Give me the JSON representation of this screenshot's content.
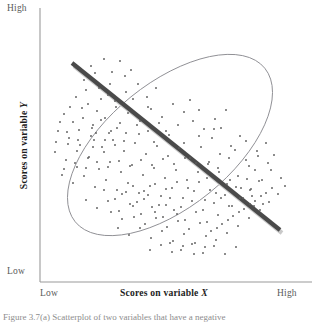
{
  "figure": {
    "caption": "Figure 3.7(a)  Scatterplot of two variables that have a negative",
    "y_axis": {
      "title_prefix": "Scores on variable ",
      "title_var": "Y",
      "high_label": "High",
      "low_label": "Low"
    },
    "x_axis": {
      "title_prefix": "Scores on variable ",
      "title_var": "X",
      "low_label": "Low",
      "high_label": "High"
    }
  },
  "colors": {
    "axis": "#9a9a9a",
    "ellipse": "#8e8e93",
    "regression_line": "#4a4a4a",
    "regression_shadow": "#c9c9c9",
    "dot": "#5c5c5c",
    "label_text": "#5a5a5a",
    "title_text": "#1d1d1d",
    "background": "#ffffff"
  },
  "chart_data": {
    "type": "scatter",
    "title": "",
    "subtitle": "",
    "xlabel": "Scores on variable X",
    "ylabel": "Scores on variable Y",
    "xlim": [
      0,
      100
    ],
    "ylim": [
      0,
      100
    ],
    "xtick_labels": [
      "Low",
      "High"
    ],
    "ytick_labels": [
      "Low",
      "High"
    ],
    "grid": false,
    "legend": null,
    "correlation": "negative",
    "annotations": [
      {
        "kind": "ellipse",
        "center": [
          170,
          145
        ],
        "rx": 122,
        "ry": 62,
        "rotation_deg": -39
      },
      {
        "kind": "regression-line",
        "x1": 72,
        "y1": 63,
        "x2": 280,
        "y2": 230
      }
    ],
    "points": [
      [
        91,
        66
      ],
      [
        104,
        59
      ],
      [
        112,
        72
      ],
      [
        84,
        80
      ],
      [
        99,
        88
      ],
      [
        120,
        61
      ],
      [
        131,
        70
      ],
      [
        108,
        95
      ],
      [
        76,
        97
      ],
      [
        88,
        104
      ],
      [
        97,
        111
      ],
      [
        115,
        101
      ],
      [
        126,
        92
      ],
      [
        138,
        84
      ],
      [
        147,
        97
      ],
      [
        156,
        88
      ],
      [
        64,
        114
      ],
      [
        73,
        122
      ],
      [
        82,
        108
      ],
      [
        93,
        125
      ],
      [
        105,
        118
      ],
      [
        117,
        128
      ],
      [
        128,
        113
      ],
      [
        140,
        121
      ],
      [
        151,
        109
      ],
      [
        162,
        117
      ],
      [
        173,
        104
      ],
      [
        184,
        112
      ],
      [
        166,
        131
      ],
      [
        178,
        125
      ],
      [
        190,
        100
      ],
      [
        199,
        110
      ],
      [
        58,
        131
      ],
      [
        69,
        138
      ],
      [
        80,
        145
      ],
      [
        91,
        136
      ],
      [
        102,
        147
      ],
      [
        113,
        140
      ],
      [
        124,
        151
      ],
      [
        135,
        143
      ],
      [
        146,
        154
      ],
      [
        157,
        146
      ],
      [
        168,
        156
      ],
      [
        179,
        148
      ],
      [
        190,
        158
      ],
      [
        201,
        147
      ],
      [
        212,
        138
      ],
      [
        221,
        128
      ],
      [
        55,
        152
      ],
      [
        66,
        160
      ],
      [
        77,
        167
      ],
      [
        88,
        158
      ],
      [
        99,
        169
      ],
      [
        110,
        162
      ],
      [
        121,
        172
      ],
      [
        132,
        165
      ],
      [
        143,
        175
      ],
      [
        154,
        168
      ],
      [
        165,
        178
      ],
      [
        176,
        170
      ],
      [
        187,
        180
      ],
      [
        198,
        172
      ],
      [
        209,
        162
      ],
      [
        220,
        154
      ],
      [
        231,
        146
      ],
      [
        240,
        136
      ],
      [
        62,
        175
      ],
      [
        73,
        183
      ],
      [
        84,
        176
      ],
      [
        95,
        187
      ],
      [
        106,
        180
      ],
      [
        117,
        190
      ],
      [
        128,
        183
      ],
      [
        139,
        193
      ],
      [
        150,
        186
      ],
      [
        161,
        196
      ],
      [
        172,
        188
      ],
      [
        183,
        198
      ],
      [
        194,
        191
      ],
      [
        205,
        200
      ],
      [
        216,
        193
      ],
      [
        227,
        184
      ],
      [
        238,
        176
      ],
      [
        249,
        166
      ],
      [
        258,
        156
      ],
      [
        86,
        200
      ],
      [
        97,
        208
      ],
      [
        108,
        201
      ],
      [
        119,
        211
      ],
      [
        130,
        204
      ],
      [
        141,
        214
      ],
      [
        152,
        207
      ],
      [
        163,
        217
      ],
      [
        174,
        210
      ],
      [
        185,
        220
      ],
      [
        196,
        212
      ],
      [
        207,
        222
      ],
      [
        218,
        215
      ],
      [
        229,
        206
      ],
      [
        240,
        198
      ],
      [
        251,
        189
      ],
      [
        262,
        180
      ],
      [
        271,
        170
      ],
      [
        118,
        228
      ],
      [
        129,
        235
      ],
      [
        140,
        228
      ],
      [
        151,
        238
      ],
      [
        162,
        231
      ],
      [
        173,
        241
      ],
      [
        184,
        234
      ],
      [
        195,
        243
      ],
      [
        206,
        236
      ],
      [
        217,
        228
      ],
      [
        228,
        220
      ],
      [
        239,
        212
      ],
      [
        250,
        204
      ],
      [
        261,
        196
      ],
      [
        272,
        188
      ],
      [
        281,
        178
      ],
      [
        150,
        250
      ],
      [
        161,
        245
      ],
      [
        172,
        252
      ],
      [
        183,
        246
      ],
      [
        194,
        254
      ],
      [
        205,
        247
      ],
      [
        216,
        240
      ],
      [
        227,
        233
      ],
      [
        238,
        226
      ],
      [
        249,
        218
      ],
      [
        260,
        210
      ],
      [
        269,
        202
      ],
      [
        278,
        194
      ],
      [
        285,
        186
      ],
      [
        95,
        73
      ],
      [
        110,
        84
      ],
      [
        125,
        76
      ],
      [
        86,
        90
      ],
      [
        101,
        99
      ],
      [
        116,
        107
      ],
      [
        133,
        99
      ],
      [
        148,
        107
      ],
      [
        70,
        107
      ],
      [
        60,
        122
      ],
      [
        79,
        130
      ],
      [
        94,
        140
      ],
      [
        109,
        133
      ],
      [
        124,
        141
      ],
      [
        139,
        134
      ],
      [
        154,
        142
      ],
      [
        169,
        135
      ],
      [
        184,
        143
      ],
      [
        199,
        136
      ],
      [
        214,
        129
      ],
      [
        229,
        158
      ],
      [
        218,
        168
      ],
      [
        207,
        178
      ],
      [
        196,
        163
      ],
      [
        185,
        158
      ],
      [
        174,
        164
      ],
      [
        163,
        159
      ],
      [
        152,
        165
      ],
      [
        141,
        160
      ],
      [
        130,
        166
      ],
      [
        119,
        161
      ],
      [
        108,
        167
      ],
      [
        97,
        162
      ],
      [
        86,
        168
      ],
      [
        75,
        163
      ],
      [
        64,
        169
      ],
      [
        104,
        190
      ],
      [
        115,
        199
      ],
      [
        126,
        192
      ],
      [
        137,
        202
      ],
      [
        148,
        195
      ],
      [
        159,
        205
      ],
      [
        170,
        198
      ],
      [
        181,
        207
      ],
      [
        192,
        201
      ],
      [
        203,
        210
      ],
      [
        214,
        203
      ],
      [
        225,
        195
      ],
      [
        236,
        187
      ],
      [
        247,
        179
      ],
      [
        134,
        217
      ],
      [
        145,
        224
      ],
      [
        156,
        218
      ],
      [
        167,
        227
      ],
      [
        178,
        221
      ],
      [
        189,
        229
      ],
      [
        200,
        223
      ],
      [
        211,
        231
      ],
      [
        222,
        224
      ],
      [
        233,
        216
      ],
      [
        244,
        209
      ],
      [
        255,
        201
      ],
      [
        266,
        193
      ],
      [
        83,
        118
      ],
      [
        92,
        128
      ],
      [
        101,
        120
      ],
      [
        111,
        131
      ],
      [
        120,
        123
      ],
      [
        68,
        144
      ],
      [
        77,
        151
      ],
      [
        193,
        121
      ],
      [
        204,
        129
      ],
      [
        215,
        119
      ],
      [
        226,
        110
      ],
      [
        235,
        150
      ],
      [
        246,
        141
      ],
      [
        255,
        170
      ],
      [
        246,
        160
      ],
      [
        257,
        151
      ],
      [
        266,
        143
      ],
      [
        274,
        155
      ],
      [
        268,
        163
      ],
      [
        259,
        181
      ],
      [
        250,
        190
      ],
      [
        170,
        243
      ],
      [
        181,
        250
      ],
      [
        192,
        244
      ],
      [
        203,
        253
      ],
      [
        214,
        246
      ],
      [
        225,
        254
      ],
      [
        236,
        247
      ],
      [
        208,
        164
      ],
      [
        219,
        172
      ],
      [
        230,
        180
      ],
      [
        241,
        188
      ],
      [
        252,
        196
      ],
      [
        263,
        204
      ],
      [
        159,
        123
      ],
      [
        148,
        131
      ],
      [
        137,
        125
      ],
      [
        126,
        133
      ],
      [
        115,
        145
      ],
      [
        104,
        152
      ],
      [
        93,
        147
      ],
      [
        188,
        188
      ],
      [
        177,
        182
      ],
      [
        166,
        189
      ],
      [
        155,
        184
      ],
      [
        144,
        191
      ],
      [
        133,
        186
      ],
      [
        122,
        194
      ],
      [
        111,
        212
      ],
      [
        122,
        219
      ],
      [
        133,
        206
      ],
      [
        144,
        199
      ],
      [
        155,
        212
      ],
      [
        166,
        205
      ],
      [
        177,
        214
      ],
      [
        199,
        182
      ],
      [
        210,
        190
      ],
      [
        221,
        198
      ],
      [
        232,
        206
      ],
      [
        243,
        198
      ],
      [
        254,
        206
      ],
      [
        89,
        157
      ],
      [
        78,
        140
      ],
      [
        67,
        132
      ],
      [
        56,
        142
      ],
      [
        105,
        140
      ],
      [
        96,
        133
      ]
    ]
  }
}
